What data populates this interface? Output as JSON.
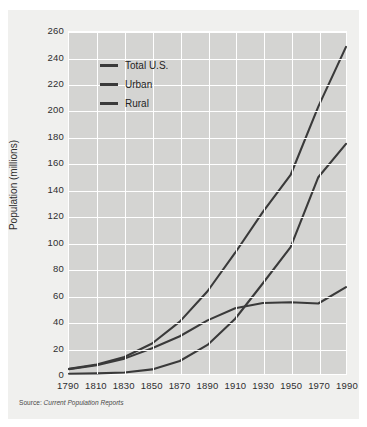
{
  "figure": {
    "source_label": "Source:",
    "source_text": "Current Population Reports"
  },
  "chart_data": {
    "type": "line",
    "title": "",
    "xlabel": "",
    "ylabel": "Population (millions)",
    "xlim": [
      1790,
      1990
    ],
    "ylim": [
      0,
      260
    ],
    "ytick_step": 20,
    "xtick_step": 20,
    "grid": true,
    "legend_position": "upper-left-inside",
    "x": [
      1790,
      1810,
      1830,
      1850,
      1870,
      1890,
      1910,
      1930,
      1950,
      1970,
      1990
    ],
    "xticklabels": [
      "1790",
      "1810",
      "1830",
      "1850",
      "1870",
      "1890",
      "1910",
      "1930",
      "1950",
      "1970",
      "1990"
    ],
    "yticklabels": [
      "0",
      "20",
      "40",
      "60",
      "80",
      "100",
      "120",
      "140",
      "160",
      "180",
      "200",
      "220",
      "240",
      "260"
    ],
    "series": [
      {
        "name": "Total U.S.",
        "color": "#3a3a3a",
        "values": [
          3.9,
          7.2,
          12.9,
          23.2,
          39.8,
          62.9,
          92.2,
          123.2,
          151.3,
          203.3,
          248.7
        ]
      },
      {
        "name": "Urban",
        "color": "#3a3a3a",
        "values": [
          0.2,
          0.5,
          1.1,
          3.5,
          9.9,
          22.1,
          42.0,
          69.0,
          96.5,
          149.6,
          175.0
        ]
      },
      {
        "name": "Rural",
        "color": "#3a3a3a",
        "values": [
          3.7,
          6.7,
          11.7,
          19.6,
          28.7,
          40.8,
          50.0,
          54.0,
          54.5,
          53.6,
          66.0
        ]
      }
    ]
  }
}
